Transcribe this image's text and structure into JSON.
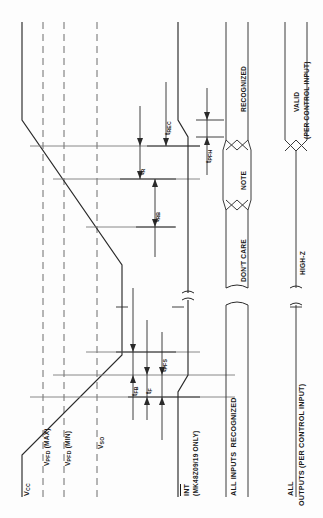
{
  "diagram": {
    "type": "timing-diagram",
    "orientation": "rotated-90-ccw",
    "title_visible": false
  },
  "signals": [
    {
      "key": "vcc",
      "name": "V",
      "sub": "CC",
      "label": "V_CC"
    },
    {
      "key": "int",
      "name": "INT",
      "sub": "",
      "label": "INT",
      "note": "(MK48Z09/19 ONLY)"
    },
    {
      "key": "inputs",
      "label": "ALL INPUTS"
    },
    {
      "key": "outputs",
      "label": "ALL",
      "note": "OUTPUTS (PER CONTROL INPUT)"
    }
  ],
  "voltage_levels": [
    {
      "key": "vpfd_max",
      "base": "V",
      "sub": "PFD",
      "qual": "(MAX)"
    },
    {
      "key": "vpfd_min",
      "base": "V",
      "sub": "PFD",
      "qual": "(MIN)"
    },
    {
      "key": "vso",
      "base": "V",
      "sub": "SO",
      "qual": ""
    }
  ],
  "timing_params": [
    {
      "key": "trec",
      "base": "t",
      "sub": "REC"
    },
    {
      "key": "tr",
      "base": "t",
      "sub": "R"
    },
    {
      "key": "trb",
      "base": "t",
      "sub": "RB"
    },
    {
      "key": "tpfh",
      "base": "t",
      "sub": "PFH"
    },
    {
      "key": "tfb",
      "base": "t",
      "sub": "FB"
    },
    {
      "key": "tf",
      "base": "t",
      "sub": "F"
    },
    {
      "key": "tpfs",
      "base": "t",
      "sub": "PFS"
    }
  ],
  "state_labels": {
    "recognized": "RECOGNIZED",
    "note": "NOTE",
    "dont_care": "DON'T CARE",
    "valid": "VALID",
    "valid_note": "(PER CONTROL INPUT)",
    "high_z": "HIGH-Z"
  },
  "signal_labels": {
    "vcc_base": "V",
    "vcc_sub": "CC",
    "int": "INT",
    "int_note": "(MK48Z09/19 ONLY)",
    "all_inputs": "ALL INPUTS",
    "inputs_recognized": "RECOGNIZED",
    "all_outputs_1": "ALL",
    "all_outputs_2": "OUTPUTS (PER CONTROL INPUT)"
  },
  "colors": {
    "ink": "#2a2a2a",
    "reference": "#7a7a7a",
    "dashed": "#6d6d6d",
    "background": "#fdfdfd"
  }
}
